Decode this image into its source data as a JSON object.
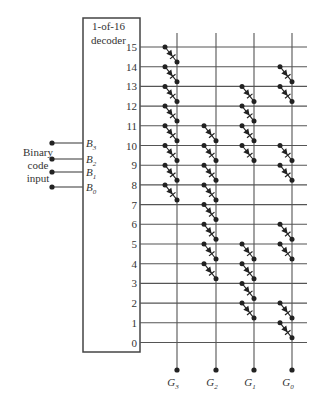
{
  "decoder": {
    "title_line1": "1-of-16",
    "title_line2": "decoder",
    "box": {
      "x": 83,
      "y": 18,
      "w": 57,
      "h": 334
    }
  },
  "input": {
    "label_lines": [
      "Binary",
      "code",
      "input"
    ],
    "pins": [
      {
        "name": "B",
        "sub": "3",
        "y": 143
      },
      {
        "name": "B",
        "sub": "2",
        "y": 159
      },
      {
        "name": "B",
        "sub": "1",
        "y": 172
      },
      {
        "name": "B",
        "sub": "0",
        "y": 187
      }
    ],
    "dot_x": 52
  },
  "rows": {
    "labels": [
      "15",
      "14",
      "13",
      "12",
      "11",
      "10",
      "9",
      "8",
      "7",
      "6",
      "5",
      "4",
      "3",
      "2",
      "1",
      "0"
    ],
    "y_start": 47,
    "y_step": 19.7,
    "x_end": 307
  },
  "outputs": [
    {
      "name": "G",
      "sub": "3",
      "x": 177
    },
    {
      "name": "G",
      "sub": "2",
      "x": 216
    },
    {
      "name": "G",
      "sub": "1",
      "x": 254
    },
    {
      "name": "G",
      "sub": "0",
      "x": 292
    }
  ],
  "output_dot_y": 370,
  "diodes": {
    "15": [
      "G3"
    ],
    "14": [
      "G3",
      "G0"
    ],
    "13": [
      "G3",
      "G1",
      "G0"
    ],
    "12": [
      "G3",
      "G1"
    ],
    "11": [
      "G3",
      "G2",
      "G1"
    ],
    "10": [
      "G3",
      "G2",
      "G1",
      "G0"
    ],
    "9": [
      "G3",
      "G2",
      "G0"
    ],
    "8": [
      "G3",
      "G2"
    ],
    "7": [
      "G2"
    ],
    "6": [
      "G2",
      "G0"
    ],
    "5": [
      "G2",
      "G1",
      "G0"
    ],
    "4": [
      "G2",
      "G1"
    ],
    "3": [
      "G1"
    ],
    "2": [
      "G1",
      "G0"
    ],
    "1": [
      "G0"
    ],
    "0": []
  },
  "colors": {
    "line": "#555555",
    "dot": "#222222",
    "text": "#333333"
  }
}
